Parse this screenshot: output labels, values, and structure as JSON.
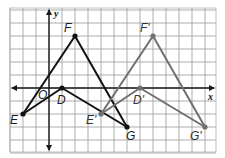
{
  "diagram": {
    "type": "coordinate-plane-translation",
    "grid": {
      "unit_px": 13,
      "origin_px": [
        49,
        88
      ],
      "x_range": [
        -3,
        13
      ],
      "y_range": [
        -5,
        6
      ],
      "left_px": 10,
      "right_px": 216,
      "top_px": 8,
      "bottom_px": 152,
      "line_color": "#9a9a9a",
      "border_color": "#b0b0b0"
    },
    "axes": {
      "x_label": "x",
      "y_label": "y",
      "origin_label": "O",
      "color": "#1a1a1a"
    },
    "figures": [
      {
        "name": "original",
        "color": "#111111",
        "vertices": [
          {
            "label": "F",
            "x": 2,
            "y": 4
          },
          {
            "label": "G",
            "x": 6,
            "y": -3
          },
          {
            "label": "D",
            "x": 1,
            "y": 0
          },
          {
            "label": "E",
            "x": -2,
            "y": -2
          }
        ]
      },
      {
        "name": "image",
        "color": "#707070",
        "vertices": [
          {
            "label": "F'",
            "x": 8,
            "y": 4
          },
          {
            "label": "G'",
            "x": 12,
            "y": -3
          },
          {
            "label": "D'",
            "x": 7,
            "y": 0
          },
          {
            "label": "E'",
            "x": 4,
            "y": -2
          }
        ]
      }
    ],
    "labels": {
      "F": "F",
      "D": "D",
      "E": "E",
      "G": "G",
      "F_prime": "F'",
      "D_prime": "D'",
      "E_prime": "E'",
      "G_prime": "G'",
      "O": "O",
      "x": "x",
      "y": "y"
    }
  }
}
